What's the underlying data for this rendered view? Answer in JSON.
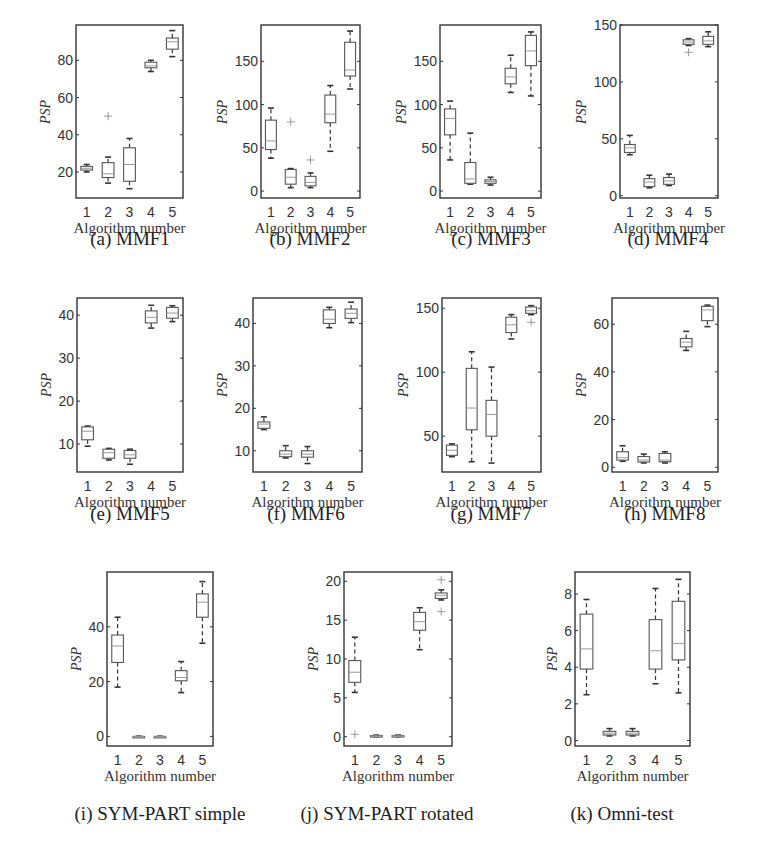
{
  "figure": {
    "ylabel": "PSP",
    "xlabel": "Algorithm number",
    "categories": [
      "1",
      "2",
      "3",
      "4",
      "5"
    ],
    "colors": {
      "frame": "#333333",
      "box": "#555555",
      "median": "#999999",
      "whisker": "#333333",
      "outlier": "#999999"
    }
  },
  "chart_data": [
    {
      "id": "a",
      "type": "boxplot",
      "title": "(a) MMF1",
      "xlabel": "Algorithm number",
      "ylabel": "PSP",
      "categories": [
        "1",
        "2",
        "3",
        "4",
        "5"
      ],
      "yticks": [
        20,
        40,
        60,
        80
      ],
      "ylim": [
        6,
        99
      ],
      "frame": {
        "x": 76,
        "y": 25,
        "w": 107,
        "h": 173
      },
      "caption_pos": {
        "x": 130,
        "y": 228
      },
      "boxes": [
        {
          "min": 20,
          "q1": 21,
          "median": 22,
          "q3": 23,
          "max": 24,
          "outliers": []
        },
        {
          "min": 14,
          "q1": 17,
          "median": 19,
          "q3": 25,
          "max": 28,
          "outliers": [
            50
          ]
        },
        {
          "min": 11,
          "q1": 15,
          "median": 24,
          "q3": 33,
          "max": 38,
          "outliers": []
        },
        {
          "min": 74,
          "q1": 76,
          "median": 77,
          "q3": 79,
          "max": 80,
          "outliers": []
        },
        {
          "min": 82,
          "q1": 86,
          "median": 90,
          "q3": 92,
          "max": 96,
          "outliers": []
        }
      ]
    },
    {
      "id": "b",
      "type": "boxplot",
      "title": "(b) MMF2",
      "xlabel": "Algorithm number",
      "ylabel": "PSP",
      "categories": [
        "1",
        "2",
        "3",
        "4",
        "5"
      ],
      "yticks": [
        0,
        50,
        100,
        150
      ],
      "ylim": [
        -8,
        192
      ],
      "frame": {
        "x": 261,
        "y": 25,
        "w": 99,
        "h": 173
      },
      "caption_pos": {
        "x": 310,
        "y": 228
      },
      "boxes": [
        {
          "min": 38,
          "q1": 48,
          "median": 58,
          "q3": 82,
          "max": 96,
          "outliers": []
        },
        {
          "min": 4,
          "q1": 8,
          "median": 16,
          "q3": 25,
          "max": 26,
          "outliers": [
            80
          ]
        },
        {
          "min": 4,
          "q1": 6,
          "median": 10,
          "q3": 17,
          "max": 21,
          "outliers": [
            36
          ]
        },
        {
          "min": 46,
          "q1": 79,
          "median": 89,
          "q3": 111,
          "max": 122,
          "outliers": []
        },
        {
          "min": 118,
          "q1": 133,
          "median": 140,
          "q3": 172,
          "max": 185,
          "outliers": []
        }
      ]
    },
    {
      "id": "c",
      "type": "boxplot",
      "title": "(c) MMF3",
      "xlabel": "Algorithm number",
      "ylabel": "PSP",
      "categories": [
        "1",
        "2",
        "3",
        "4",
        "5"
      ],
      "yticks": [
        0,
        50,
        100,
        150
      ],
      "ylim": [
        -8,
        192
      ],
      "frame": {
        "x": 440,
        "y": 25,
        "w": 101,
        "h": 173
      },
      "caption_pos": {
        "x": 491,
        "y": 228
      },
      "boxes": [
        {
          "min": 36,
          "q1": 65,
          "median": 84,
          "q3": 95,
          "max": 104,
          "outliers": []
        },
        {
          "min": 8,
          "q1": 9,
          "median": 14,
          "q3": 33,
          "max": 67,
          "outliers": []
        },
        {
          "min": 7,
          "q1": 9,
          "median": 11,
          "q3": 13,
          "max": 16,
          "outliers": []
        },
        {
          "min": 114,
          "q1": 124,
          "median": 132,
          "q3": 142,
          "max": 157,
          "outliers": []
        },
        {
          "min": 110,
          "q1": 145,
          "median": 162,
          "q3": 180,
          "max": 184,
          "outliers": []
        }
      ]
    },
    {
      "id": "d",
      "type": "boxplot",
      "title": "(d) MMF4",
      "xlabel": "Algorithm number",
      "ylabel": "PSP",
      "categories": [
        "1",
        "2",
        "3",
        "4",
        "5"
      ],
      "yticks": [
        0,
        50,
        100,
        150
      ],
      "ylim": [
        -2,
        150
      ],
      "frame": {
        "x": 620,
        "y": 25,
        "w": 98,
        "h": 173
      },
      "caption_pos": {
        "x": 668,
        "y": 228
      },
      "boxes": [
        {
          "min": 36,
          "q1": 38,
          "median": 42,
          "q3": 45,
          "max": 53,
          "outliers": []
        },
        {
          "min": 7,
          "q1": 8,
          "median": 12,
          "q3": 15,
          "max": 18,
          "outliers": []
        },
        {
          "min": 9,
          "q1": 10,
          "median": 13,
          "q3": 16,
          "max": 19,
          "outliers": []
        },
        {
          "min": 132,
          "q1": 133,
          "median": 135,
          "q3": 137,
          "max": 138,
          "outliers": [
            126
          ]
        },
        {
          "min": 131,
          "q1": 133,
          "median": 136,
          "q3": 140,
          "max": 144,
          "outliers": []
        }
      ]
    },
    {
      "id": "e",
      "type": "boxplot",
      "title": "(e) MMF5",
      "xlabel": "Algorithm number",
      "ylabel": "PSP",
      "categories": [
        "1",
        "2",
        "3",
        "4",
        "5"
      ],
      "yticks": [
        10,
        20,
        30,
        40
      ],
      "ylim": [
        3.5,
        44
      ],
      "frame": {
        "x": 77,
        "y": 298,
        "w": 106,
        "h": 174
      },
      "caption_pos": {
        "x": 130,
        "y": 503
      },
      "boxes": [
        {
          "min": 9.5,
          "q1": 11,
          "median": 13,
          "q3": 14,
          "max": 14.2,
          "outliers": []
        },
        {
          "min": 6.3,
          "q1": 6.7,
          "median": 8,
          "q3": 8.8,
          "max": 9,
          "outliers": []
        },
        {
          "min": 5.3,
          "q1": 6.7,
          "median": 7.5,
          "q3": 8.5,
          "max": 8.8,
          "outliers": []
        },
        {
          "min": 37,
          "q1": 38.2,
          "median": 39.5,
          "q3": 41,
          "max": 42.3,
          "outliers": []
        },
        {
          "min": 38.5,
          "q1": 39.3,
          "median": 40.5,
          "q3": 41.8,
          "max": 42.2,
          "outliers": []
        }
      ]
    },
    {
      "id": "f",
      "type": "boxplot",
      "title": "(f) MMF6",
      "xlabel": "Algorithm number",
      "ylabel": "PSP",
      "categories": [
        "1",
        "2",
        "3",
        "4",
        "5"
      ],
      "yticks": [
        10,
        20,
        30,
        40
      ],
      "ylim": [
        5,
        46
      ],
      "frame": {
        "x": 253,
        "y": 298,
        "w": 109,
        "h": 174
      },
      "caption_pos": {
        "x": 306,
        "y": 503
      },
      "boxes": [
        {
          "min": 15,
          "q1": 15.3,
          "median": 16.3,
          "q3": 16.8,
          "max": 18,
          "outliers": []
        },
        {
          "min": 8.3,
          "q1": 8.6,
          "median": 9.2,
          "q3": 10,
          "max": 11.2,
          "outliers": []
        },
        {
          "min": 7,
          "q1": 8.5,
          "median": 9.2,
          "q3": 10,
          "max": 11,
          "outliers": []
        },
        {
          "min": 39,
          "q1": 40,
          "median": 41,
          "q3": 43.2,
          "max": 43.8,
          "outliers": []
        },
        {
          "min": 40.2,
          "q1": 41.2,
          "median": 42.4,
          "q3": 43.4,
          "max": 45,
          "outliers": []
        }
      ]
    },
    {
      "id": "g",
      "type": "boxplot",
      "title": "(g) MMF7",
      "xlabel": "Algorithm number",
      "ylabel": "PSP",
      "categories": [
        "1",
        "2",
        "3",
        "4",
        "5"
      ],
      "yticks": [
        50,
        100,
        150
      ],
      "ylim": [
        22,
        158
      ],
      "frame": {
        "x": 442,
        "y": 298,
        "w": 99,
        "h": 174
      },
      "caption_pos": {
        "x": 491,
        "y": 503
      },
      "boxes": [
        {
          "min": 34,
          "q1": 35,
          "median": 39,
          "q3": 43,
          "max": 44,
          "outliers": []
        },
        {
          "min": 30,
          "q1": 55,
          "median": 72,
          "q3": 103,
          "max": 116,
          "outliers": []
        },
        {
          "min": 29,
          "q1": 50,
          "median": 67,
          "q3": 78,
          "max": 104,
          "outliers": []
        },
        {
          "min": 126,
          "q1": 131,
          "median": 137,
          "q3": 143,
          "max": 145,
          "outliers": []
        },
        {
          "min": 145,
          "q1": 146,
          "median": 148,
          "q3": 151,
          "max": 152,
          "outliers": [
            139
          ]
        }
      ]
    },
    {
      "id": "h",
      "type": "boxplot",
      "title": "(h) MMF8",
      "xlabel": "Algorithm number",
      "ylabel": "PSP",
      "categories": [
        "1",
        "2",
        "3",
        "4",
        "5"
      ],
      "yticks": [
        0,
        20,
        40,
        60
      ],
      "ylim": [
        -2,
        71
      ],
      "frame": {
        "x": 612,
        "y": 298,
        "w": 106,
        "h": 174
      },
      "caption_pos": {
        "x": 665,
        "y": 503
      },
      "boxes": [
        {
          "min": 2.5,
          "q1": 3,
          "median": 4,
          "q3": 6.5,
          "max": 9,
          "outliers": []
        },
        {
          "min": 1.8,
          "q1": 2.2,
          "median": 3,
          "q3": 4.5,
          "max": 5.5,
          "outliers": []
        },
        {
          "min": 1.8,
          "q1": 2.3,
          "median": 3,
          "q3": 5.8,
          "max": 6.5,
          "outliers": []
        },
        {
          "min": 49,
          "q1": 50.5,
          "median": 52.5,
          "q3": 54,
          "max": 57,
          "outliers": []
        },
        {
          "min": 59,
          "q1": 61.5,
          "median": 66,
          "q3": 67.5,
          "max": 68,
          "outliers": []
        }
      ]
    },
    {
      "id": "i",
      "type": "boxplot",
      "title": "(i) SYM-PART simple",
      "xlabel": "Algorithm number",
      "ylabel": "PSP",
      "categories": [
        "1",
        "2",
        "3",
        "4",
        "5"
      ],
      "yticks": [
        0,
        20,
        40
      ],
      "ylim": [
        -3.5,
        60
      ],
      "frame": {
        "x": 107,
        "y": 572,
        "w": 106,
        "h": 174
      },
      "caption_pos": {
        "x": 160,
        "y": 803
      },
      "boxes": [
        {
          "min": 18,
          "q1": 27,
          "median": 33,
          "q3": 37,
          "max": 43.5,
          "outliers": []
        },
        {
          "min": 0,
          "q1": 0,
          "median": 0,
          "q3": 0,
          "max": 0,
          "outliers": []
        },
        {
          "min": 0,
          "q1": 0,
          "median": 0,
          "q3": 0,
          "max": 0,
          "outliers": []
        },
        {
          "min": 16,
          "q1": 20.3,
          "median": 21.5,
          "q3": 24,
          "max": 27.3,
          "outliers": []
        },
        {
          "min": 34,
          "q1": 43.5,
          "median": 49,
          "q3": 52,
          "max": 56.5,
          "outliers": []
        }
      ]
    },
    {
      "id": "j",
      "type": "boxplot",
      "title": "(j) SYM-PART rotated",
      "xlabel": "Algorithm number",
      "ylabel": "PSP",
      "categories": [
        "1",
        "2",
        "3",
        "4",
        "5"
      ],
      "yticks": [
        0,
        5,
        10,
        15,
        20
      ],
      "ylim": [
        -1.2,
        21.2
      ],
      "frame": {
        "x": 344,
        "y": 572,
        "w": 108,
        "h": 174
      },
      "caption_pos": {
        "x": 387,
        "y": 803
      },
      "boxes": [
        {
          "min": 5.7,
          "q1": 7,
          "median": 8.3,
          "q3": 9.8,
          "max": 12.8,
          "outliers": [
            0.3
          ]
        },
        {
          "min": 0,
          "q1": 0.05,
          "median": 0.1,
          "q3": 0.15,
          "max": 0.2,
          "outliers": []
        },
        {
          "min": 0,
          "q1": 0.05,
          "median": 0.1,
          "q3": 0.15,
          "max": 0.2,
          "outliers": []
        },
        {
          "min": 11.2,
          "q1": 13.7,
          "median": 14.8,
          "q3": 16,
          "max": 16.6,
          "outliers": []
        },
        {
          "min": 17.6,
          "q1": 17.8,
          "median": 18.2,
          "q3": 18.5,
          "max": 18.9,
          "outliers": [
            20.2,
            16.1
          ]
        }
      ]
    },
    {
      "id": "k",
      "type": "boxplot",
      "title": "(k) Omni-test",
      "xlabel": "Algorithm number",
      "ylabel": "PSP",
      "categories": [
        "1",
        "2",
        "3",
        "4",
        "5"
      ],
      "yticks": [
        0,
        2,
        4,
        6,
        8
      ],
      "ylim": [
        -0.3,
        9.2
      ],
      "frame": {
        "x": 575,
        "y": 572,
        "w": 115,
        "h": 174
      },
      "caption_pos": {
        "x": 622,
        "y": 803
      },
      "boxes": [
        {
          "min": 2.5,
          "q1": 3.9,
          "median": 5,
          "q3": 6.9,
          "max": 7.7,
          "outliers": []
        },
        {
          "min": 0.25,
          "q1": 0.3,
          "median": 0.4,
          "q3": 0.5,
          "max": 0.65,
          "outliers": []
        },
        {
          "min": 0.25,
          "q1": 0.3,
          "median": 0.4,
          "q3": 0.5,
          "max": 0.65,
          "outliers": []
        },
        {
          "min": 3.1,
          "q1": 3.9,
          "median": 4.9,
          "q3": 6.6,
          "max": 8.3,
          "outliers": []
        },
        {
          "min": 2.6,
          "q1": 4.4,
          "median": 5.3,
          "q3": 7.6,
          "max": 8.8,
          "outliers": []
        }
      ]
    }
  ]
}
